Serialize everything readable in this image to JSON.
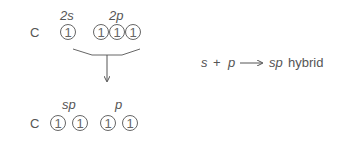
{
  "top": {
    "atom": "C",
    "subshell_labels": [
      "2s",
      "2p"
    ],
    "orbitals_2s": [
      "1"
    ],
    "orbitals_2p": [
      "1",
      "1",
      "1"
    ]
  },
  "bottom": {
    "atom": "C",
    "subshell_labels": [
      "sp",
      "p"
    ],
    "orbitals_sp": [
      "1",
      "1"
    ],
    "orbitals_p": [
      "1",
      "1"
    ]
  },
  "equation": {
    "lhs_s": "s",
    "plus": "+",
    "lhs_p": "p",
    "rhs_sp": "sp",
    "rhs_text": "hybrid"
  }
}
